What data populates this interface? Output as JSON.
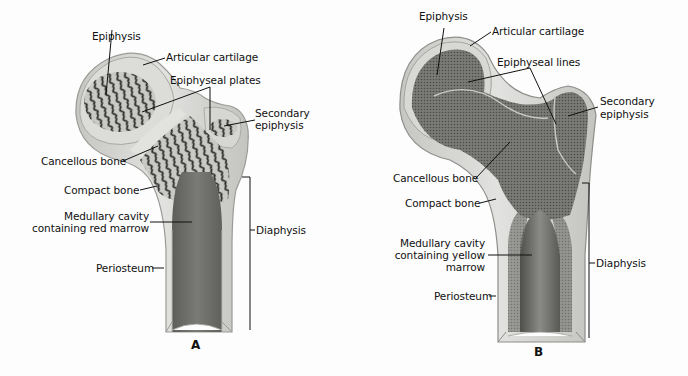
{
  "figure": {
    "panels": [
      {
        "id": "A",
        "letter": "A",
        "labels": {
          "epiphysis": "Epiphysis",
          "articular_cartilage": "Articular cartilage",
          "epiphyseal_structure": "Epiphyseal plates",
          "secondary_epiphysis_1": "Secondary",
          "secondary_epiphysis_2": "epiphysis",
          "cancellous_bone": "Cancellous bone",
          "compact_bone": "Compact bone",
          "medullary_cavity_1": "Medullary cavity",
          "medullary_cavity_2": "containing red marrow",
          "periosteum": "Periosteum",
          "diaphysis": "Diaphysis"
        }
      },
      {
        "id": "B",
        "letter": "B",
        "labels": {
          "epiphysis": "Epiphysis",
          "articular_cartilage": "Articular cartilage",
          "epiphyseal_structure": "Epiphyseal lines",
          "secondary_epiphysis_1": "Secondary",
          "secondary_epiphysis_2": "epiphysis",
          "cancellous_bone": "Cancellous bone",
          "compact_bone": "Compact bone",
          "medullary_cavity_1": "Medullary cavity",
          "medullary_cavity_2": "containing yellow",
          "medullary_cavity_3": "marrow",
          "periosteum": "Periosteum",
          "diaphysis": "Diaphysis"
        }
      }
    ],
    "colors": {
      "background": "#fdfdfd",
      "cartilage": "#dedfdc",
      "compact_bone": "#d2d3cf",
      "cancellous_dark": "#5a5a58",
      "marrow_red_panel": "#6f6f6c",
      "marrow_yellow_panel": "#7c7c79",
      "leader_line": "#111111"
    }
  }
}
